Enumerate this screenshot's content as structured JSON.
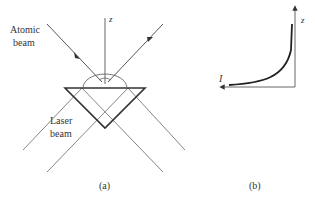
{
  "panel_a": {
    "axis_label": "z",
    "atomic_beam_label_line1": "Atomic",
    "atomic_beam_label_line2": "beam",
    "laser_beam_label_line1": "Laser",
    "laser_beam_label_line2": "beam",
    "caption": "(a)"
  },
  "panel_b": {
    "y_axis_label": "z",
    "x_axis_label": "I",
    "caption": "(b)"
  },
  "colors": {
    "line": "#555555",
    "prism": "#333333",
    "text": "#333333"
  }
}
